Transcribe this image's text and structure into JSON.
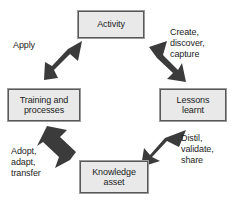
{
  "diagram": {
    "background_color": "#ffffff",
    "node_fill_color": "#e9e9e9",
    "node_border_color": "#585858",
    "arrow_color": "#3b3b3b",
    "text_color": "#1c1c1c",
    "nodes": [
      {
        "id": "activity",
        "label": "Activity"
      },
      {
        "id": "lessons",
        "label": "Lessons\nlearnt"
      },
      {
        "id": "knowledge",
        "label": "Knowledge\nasset"
      },
      {
        "id": "training",
        "label": "Training and\nprocesses"
      }
    ],
    "edges": [
      {
        "id": "activity-to-lessons",
        "label": "Create,\ndiscover,\ncapture",
        "direction": "down-right"
      },
      {
        "id": "lessons-to-knowledge",
        "label": "Distil,\nvalidate,\nshare",
        "direction": "down-left"
      },
      {
        "id": "knowledge-to-training",
        "label": "Adopt,\nadapt,\ntransfer",
        "direction": "up-left"
      },
      {
        "id": "training-to-activity",
        "label": "Apply",
        "direction": "up-right"
      }
    ]
  }
}
